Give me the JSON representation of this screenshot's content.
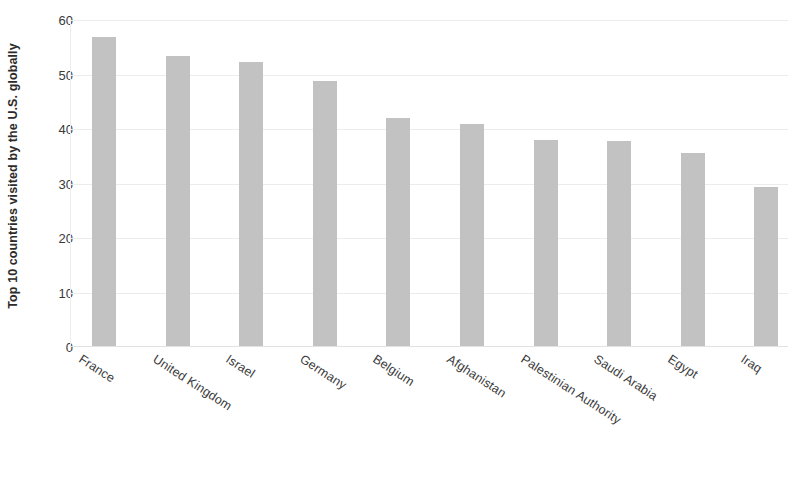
{
  "chart_data": {
    "type": "bar",
    "title": "",
    "subtitle": "",
    "xlabel": "",
    "ylabel": "Top 10 countries visited by the U.S. globally",
    "categories": [
      "France",
      "United Kingdom",
      "Israel",
      "Germany",
      "Belgium",
      "Afghanistan",
      "Palestinian Authority",
      "Saudi Arabia",
      "Egypt",
      "Iraq"
    ],
    "values": [
      56.8,
      53.4,
      52.3,
      48.9,
      42.1,
      40.9,
      38.0,
      37.8,
      35.6,
      29.4
    ],
    "ylim": [
      0,
      60
    ],
    "yticks": [
      0,
      10,
      20,
      30,
      40,
      50,
      60
    ],
    "ytick_labels": [
      "0",
      "10",
      "20",
      "30",
      "40",
      "50",
      "60"
    ],
    "grid": true,
    "grid_axis": "y",
    "legend": false,
    "legend_position": "none",
    "bar_color": "#c2c2c2",
    "background_color": "#ffffff",
    "text_color": "#3a3a3a"
  }
}
